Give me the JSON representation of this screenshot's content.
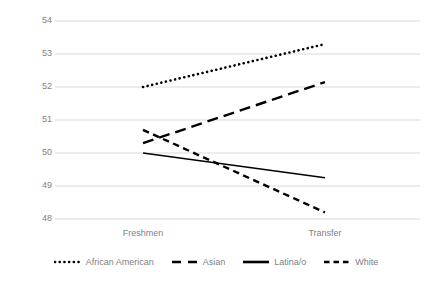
{
  "chart_data": {
    "type": "line",
    "title": "",
    "xlabel": "",
    "ylabel": "Discrimination and Bias on Campus Scores",
    "categories": [
      "Freshmen",
      "Transfer"
    ],
    "ylim": [
      48,
      54
    ],
    "yticks": [
      48,
      49,
      50,
      51,
      52,
      53,
      54
    ],
    "ytick_labels": [
      "48",
      "49",
      "50",
      "51",
      "52",
      "53",
      "54"
    ],
    "grid": true,
    "legend_position": "bottom",
    "series": [
      {
        "name": "African American",
        "values": [
          52.0,
          53.3
        ],
        "style": "dotted",
        "color": "#000000"
      },
      {
        "name": "Asian",
        "values": [
          50.3,
          52.15
        ],
        "style": "long-dash",
        "color": "#000000"
      },
      {
        "name": "Latina/o",
        "values": [
          50.0,
          49.25
        ],
        "style": "solid",
        "color": "#000000"
      },
      {
        "name": "White",
        "values": [
          50.7,
          48.2
        ],
        "style": "short-dash",
        "color": "#000000"
      }
    ]
  },
  "axis": {
    "y_title": "Discrimination and Bias on Campus Scores",
    "y_labels": {
      "t54": "54",
      "t53": "53",
      "t52": "52",
      "t51": "51",
      "t50": "50",
      "t49": "49",
      "t48": "48"
    },
    "x_labels": {
      "freshmen": "Freshmen",
      "transfer": "Transfer"
    }
  },
  "legend": {
    "items": [
      {
        "label": "African American"
      },
      {
        "label": "Asian"
      },
      {
        "label": "Latina/o"
      },
      {
        "label": "White"
      }
    ]
  },
  "colors": {
    "series": "#000000",
    "gridline": "#d9d9d9",
    "text": "#7f7f7f"
  }
}
